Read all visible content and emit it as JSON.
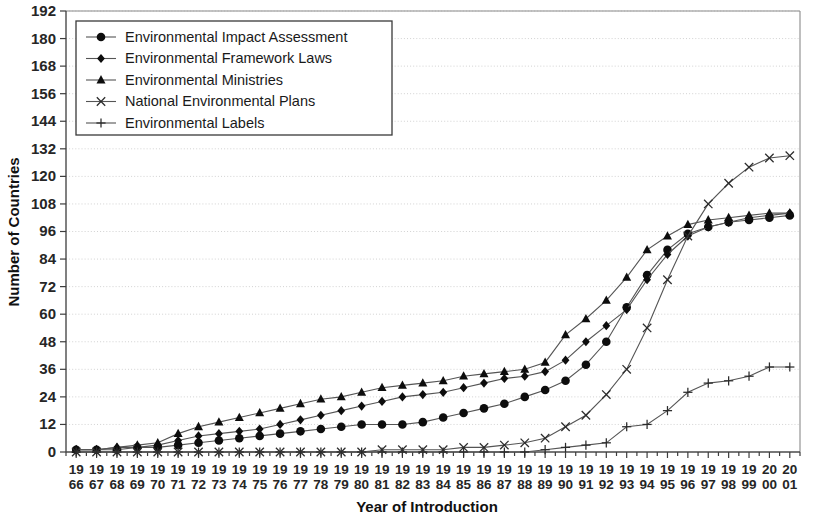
{
  "chart_data": {
    "type": "line",
    "title": "",
    "xlabel": "Year of Introduction",
    "ylabel": "Number of Countries",
    "ylim": [
      0,
      192
    ],
    "ytick_step": 12,
    "yticks": [
      0,
      12,
      24,
      36,
      48,
      60,
      72,
      84,
      96,
      108,
      120,
      132,
      144,
      156,
      168,
      180,
      192
    ],
    "grid": true,
    "legend_position": "top-left-inside",
    "categories": [
      1966,
      1967,
      1968,
      1969,
      1970,
      1971,
      1972,
      1973,
      1974,
      1975,
      1976,
      1977,
      1978,
      1979,
      1980,
      1981,
      1982,
      1983,
      1984,
      1985,
      1986,
      1987,
      1988,
      1989,
      1990,
      1991,
      1992,
      1993,
      1994,
      1995,
      1996,
      1997,
      1998,
      1999,
      2000,
      2001
    ],
    "xtick_labels_top": [
      "19",
      "19",
      "19",
      "19",
      "19",
      "19",
      "19",
      "19",
      "19",
      "19",
      "19",
      "19",
      "19",
      "19",
      "19",
      "19",
      "19",
      "19",
      "19",
      "19",
      "19",
      "19",
      "19",
      "19",
      "19",
      "19",
      "19",
      "19",
      "19",
      "19",
      "19",
      "19",
      "19",
      "19",
      "20",
      "20"
    ],
    "xtick_labels_bottom": [
      "66",
      "67",
      "68",
      "69",
      "70",
      "71",
      "72",
      "73",
      "74",
      "75",
      "76",
      "77",
      "78",
      "79",
      "80",
      "81",
      "82",
      "83",
      "84",
      "85",
      "86",
      "87",
      "88",
      "89",
      "90",
      "91",
      "92",
      "93",
      "94",
      "95",
      "96",
      "97",
      "98",
      "99",
      "00",
      "01"
    ],
    "series": [
      {
        "name": "Environmental Impact Assessment",
        "marker": "circle",
        "values": [
          1,
          1,
          1,
          2,
          2,
          3,
          4,
          5,
          6,
          7,
          8,
          9,
          10,
          11,
          12,
          12,
          12,
          13,
          15,
          17,
          19,
          21,
          24,
          27,
          31,
          38,
          48,
          63,
          77,
          88,
          95,
          98,
          100,
          101,
          102,
          103
        ]
      },
      {
        "name": "Environmental Framework Laws",
        "marker": "diamond",
        "values": [
          1,
          1,
          2,
          2,
          3,
          5,
          7,
          8,
          9,
          10,
          12,
          14,
          16,
          18,
          20,
          22,
          24,
          25,
          26,
          28,
          30,
          32,
          33,
          35,
          40,
          48,
          55,
          62,
          75,
          86,
          94,
          98,
          100,
          102,
          103,
          104
        ]
      },
      {
        "name": "Environmental Ministries",
        "marker": "triangle",
        "values": [
          1,
          1,
          2,
          3,
          4,
          8,
          11,
          13,
          15,
          17,
          19,
          21,
          23,
          24,
          26,
          28,
          29,
          30,
          31,
          33,
          34,
          35,
          36,
          39,
          51,
          58,
          66,
          76,
          88,
          94,
          99,
          101,
          102,
          103,
          104,
          104
        ]
      },
      {
        "name": "National Environmental Plans",
        "marker": "cross",
        "values": [
          0,
          0,
          0,
          0,
          0,
          0,
          0,
          0,
          0,
          0,
          0,
          0,
          0,
          0,
          0,
          1,
          1,
          1,
          1,
          2,
          2,
          3,
          4,
          6,
          11,
          16,
          25,
          36,
          54,
          75,
          94,
          108,
          117,
          124,
          128,
          129
        ]
      },
      {
        "name": "Environmental Labels",
        "marker": "plus",
        "values": [
          0,
          0,
          0,
          0,
          0,
          0,
          0,
          0,
          0,
          0,
          0,
          0,
          0,
          0,
          0,
          0,
          0,
          0,
          0,
          0,
          0,
          0,
          0,
          1,
          2,
          3,
          4,
          11,
          12,
          18,
          26,
          30,
          31,
          33,
          37,
          37
        ]
      }
    ]
  },
  "legend": {
    "entries": [
      {
        "label": "Environmental Impact Assessment",
        "marker": "circle"
      },
      {
        "label": "Environmental Framework Laws",
        "marker": "diamond"
      },
      {
        "label": "Environmental Ministries",
        "marker": "triangle"
      },
      {
        "label": "National Environmental Plans",
        "marker": "cross"
      },
      {
        "label": "Environmental Labels",
        "marker": "plus"
      }
    ]
  },
  "colors": {
    "line": "#555555",
    "marker": "#0d0d0d",
    "grid": "#d2d2d2",
    "axis": "#4a4a4a",
    "text": "#1a1a1a",
    "background": "#ffffff"
  }
}
